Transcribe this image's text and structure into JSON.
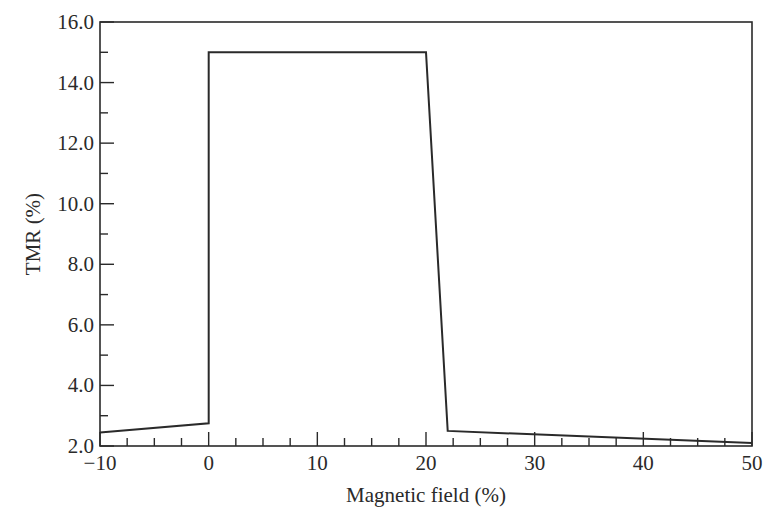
{
  "chart_data": {
    "type": "line",
    "title": "",
    "xlabel": "Magnetic field (%)",
    "ylabel": "TMR (%)",
    "xlim": [
      -10,
      50
    ],
    "ylim": [
      2.0,
      16.0
    ],
    "x_ticks": [
      -10,
      0,
      10,
      20,
      30,
      40,
      50
    ],
    "x_tick_labels": [
      "−10",
      "0",
      "10",
      "20",
      "30",
      "40",
      "50"
    ],
    "y_ticks": [
      2.0,
      4.0,
      6.0,
      8.0,
      10.0,
      12.0,
      14.0,
      16.0
    ],
    "y_tick_labels": [
      "2.0",
      "4.0",
      "6.0",
      "8.0",
      "10.0",
      "12.0",
      "14.0",
      "16.0"
    ],
    "grid": false,
    "legend": null,
    "series": [
      {
        "name": "TMR",
        "color": "#2a2a2a",
        "x": [
          -10,
          0,
          0,
          20,
          22,
          50
        ],
        "y": [
          2.45,
          2.75,
          15.0,
          15.0,
          2.5,
          2.1
        ]
      }
    ]
  }
}
